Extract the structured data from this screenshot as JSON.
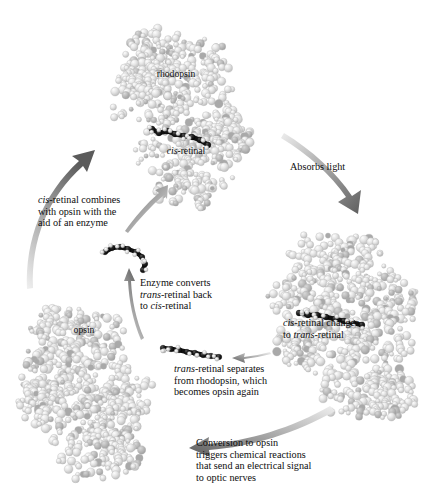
{
  "figure": {
    "background_color": "#ffffff",
    "text_color": "#0d0d0d"
  },
  "labels": {
    "rhodopsin": "rhodopsin",
    "cis_retinal": "cis-retinal",
    "cis_retinal_italic_prefix": "cis",
    "cis_retinal_rest": "-retinal",
    "opsin": "opsin"
  },
  "captions": {
    "absorbs_light": "Absorbs light",
    "cis_changes_line1_italic": "cis",
    "cis_changes_line1_rest": "-retinal changes",
    "cis_changes_line2_rest": "to ",
    "cis_changes_line2_italic": "trans",
    "cis_changes_line2_tail": "-retinal",
    "trans_separates_line1_italic": "trans",
    "trans_separates_line1_rest": "-retinal separates",
    "trans_separates_line2": "from rhodopsin, which",
    "trans_separates_line3": "becomes opsin again",
    "conversion_line1": "Conversion to opsin",
    "conversion_line2": "triggers chemical reactions",
    "conversion_line3": "that send an electrical signal",
    "conversion_line4": "to optic nerves",
    "enzyme_line1": "Enzyme converts",
    "enzyme_line2_italic": "trans",
    "enzyme_line2_rest": "-retinal back",
    "enzyme_line3_rest": "to ",
    "enzyme_line3_italic": "cis",
    "enzyme_line3_tail": "-retinal",
    "combines_line1_italic": "cis",
    "combines_line1_rest": "-retinal combines",
    "combines_line2": "with opsin with the",
    "combines_line3": "aid of an enzyme"
  },
  "colors": {
    "protein_light": "#ececec",
    "protein_mid": "#d6d6d6",
    "protein_shadow": "#b9b9b9",
    "protein_accent": "#a9a9a9",
    "retinal_dark": "#121212",
    "retinal_light": "#e8e8e8",
    "arrow_dark": "#6b6b6b",
    "arrow_light": "#e6e6e6"
  },
  "structures": [
    {
      "name": "rhodopsin-protein",
      "role": "protein with embedded cis-retinal",
      "position": "top-center"
    },
    {
      "name": "rhodopsin-activated-protein",
      "role": "protein with embedded trans-retinal",
      "position": "right"
    },
    {
      "name": "opsin-protein",
      "role": "protein without retinal",
      "position": "bottom-left"
    },
    {
      "name": "free-cis-retinal",
      "role": "bent retinal molecule",
      "position": "center-left"
    },
    {
      "name": "free-trans-retinal",
      "role": "straight retinal molecule",
      "position": "center"
    }
  ],
  "arrows": [
    {
      "name": "arrow-absorbs-light",
      "from": "rhodopsin",
      "to": "activated rhodopsin",
      "label": "Absorbs light"
    },
    {
      "name": "arrow-conversion",
      "from": "activated rhodopsin",
      "to": "opsin",
      "label": "Conversion to opsin"
    },
    {
      "name": "arrow-trans-separates",
      "from": "activated rhodopsin",
      "to": "free trans-retinal",
      "label": "trans-retinal separates"
    },
    {
      "name": "arrow-enzyme-converts",
      "from": "free trans-retinal",
      "to": "free cis-retinal",
      "label": "Enzyme converts"
    },
    {
      "name": "arrow-cis-combines",
      "from": "opsin",
      "to": "rhodopsin",
      "label": "cis-retinal combines"
    },
    {
      "name": "arrow-cis-into-rhodopsin",
      "from": "free cis-retinal",
      "to": "rhodopsin",
      "label": ""
    }
  ]
}
